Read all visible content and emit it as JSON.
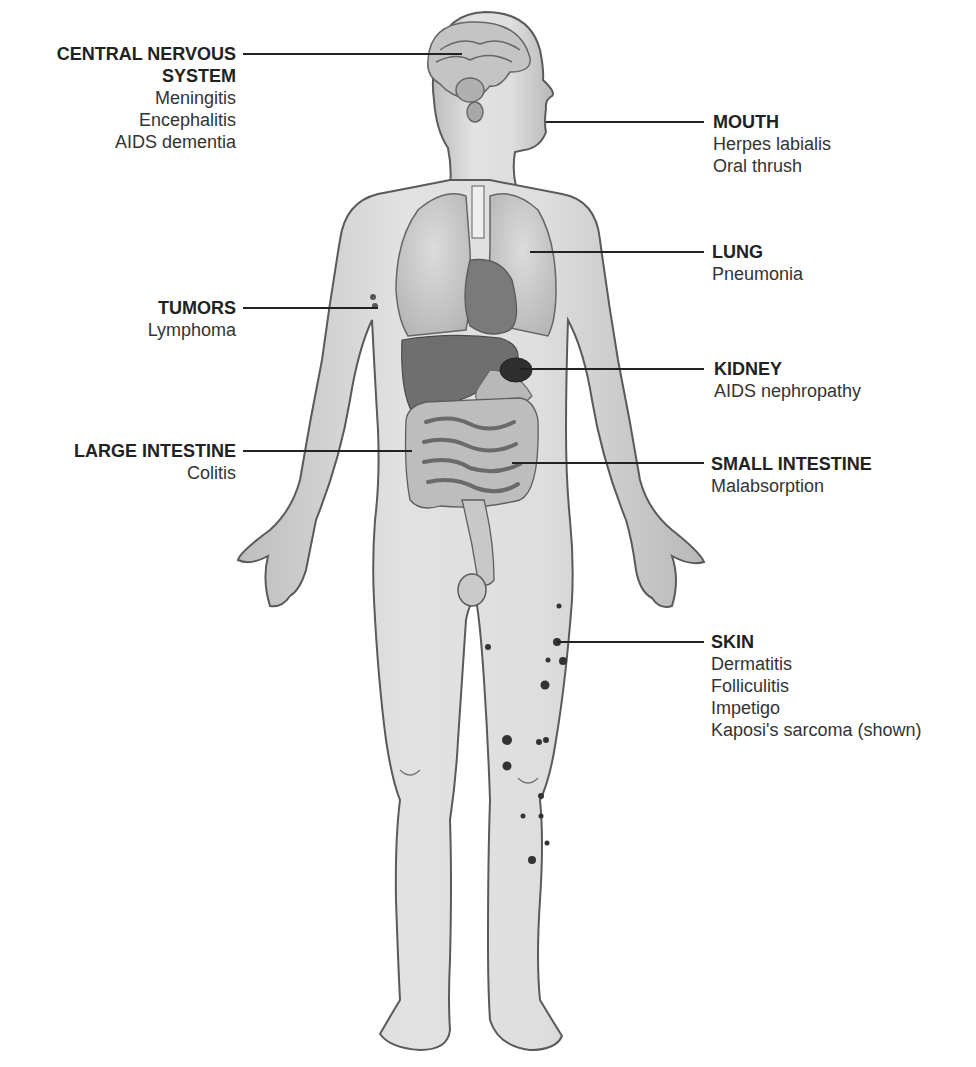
{
  "diagram": {
    "type": "anatomical-callout",
    "colors": {
      "background": "#ffffff",
      "skin": "#d9d9d9",
      "outline": "#5a5a5a",
      "organ_dark": "#6e6e6e",
      "lesion": "#333333",
      "leader": "#222222"
    }
  },
  "labels": [
    {
      "id": "cns",
      "side": "left",
      "title_lines": [
        "CENTRAL NERVOUS",
        "SYSTEM"
      ],
      "items": [
        "Meningitis",
        "Encephalitis",
        "AIDS dementia"
      ],
      "pointer": {
        "from": [
          243,
          54
        ],
        "to": [
          462,
          54
        ]
      }
    },
    {
      "id": "mouth",
      "side": "right",
      "title_lines": [
        "MOUTH"
      ],
      "items": [
        "Herpes labialis",
        "Oral thrush"
      ],
      "pointer": {
        "from": [
          546,
          122
        ],
        "to": [
          704,
          122
        ]
      }
    },
    {
      "id": "lung",
      "side": "right",
      "title_lines": [
        "LUNG"
      ],
      "items": [
        "Pneumonia"
      ],
      "pointer": {
        "from": [
          530,
          252
        ],
        "to": [
          704,
          252
        ]
      }
    },
    {
      "id": "tumors",
      "side": "left",
      "title_lines": [
        "TUMORS"
      ],
      "items": [
        "Lymphoma"
      ],
      "pointer": {
        "from": [
          243,
          308
        ],
        "to": [
          378,
          308
        ]
      }
    },
    {
      "id": "kidney",
      "side": "right",
      "title_lines": [
        "KIDNEY"
      ],
      "items": [
        "AIDS nephropathy"
      ],
      "pointer": {
        "from": [
          520,
          369
        ],
        "to": [
          704,
          369
        ]
      }
    },
    {
      "id": "large-intestine",
      "side": "left",
      "title_lines": [
        "LARGE INTESTINE"
      ],
      "items": [
        "Colitis"
      ],
      "pointer": {
        "from": [
          243,
          451
        ],
        "to": [
          412,
          451
        ]
      }
    },
    {
      "id": "small-intestine",
      "side": "right",
      "title_lines": [
        "SMALL INTESTINE"
      ],
      "items": [
        "Malabsorption"
      ],
      "pointer": {
        "from": [
          512,
          463
        ],
        "to": [
          704,
          463
        ]
      }
    },
    {
      "id": "skin",
      "side": "right",
      "title_lines": [
        "SKIN"
      ],
      "items": [
        "Dermatitis",
        "Folliculitis",
        "Impetigo",
        "Kaposi's sarcoma (shown)"
      ],
      "pointer": {
        "from": [
          557,
          642
        ],
        "to": [
          704,
          642
        ]
      }
    }
  ]
}
